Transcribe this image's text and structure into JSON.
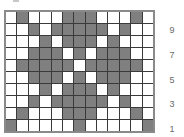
{
  "pattern": {
    "columns": 13,
    "rows": 10,
    "fill_color": "#7f7f7f",
    "empty_color": "#ffffff",
    "grid": [
      [
        0,
        1,
        0,
        0,
        0,
        1,
        1,
        1,
        0,
        0,
        0,
        1,
        0
      ],
      [
        0,
        0,
        1,
        0,
        1,
        1,
        1,
        1,
        1,
        0,
        1,
        0,
        0
      ],
      [
        0,
        0,
        0,
        1,
        0,
        1,
        1,
        1,
        0,
        1,
        0,
        0,
        0
      ],
      [
        0,
        0,
        1,
        1,
        1,
        0,
        1,
        0,
        1,
        1,
        1,
        0,
        0
      ],
      [
        0,
        1,
        1,
        1,
        1,
        1,
        0,
        1,
        1,
        1,
        1,
        1,
        0
      ],
      [
        0,
        0,
        1,
        1,
        1,
        0,
        1,
        0,
        1,
        1,
        1,
        0,
        0
      ],
      [
        0,
        0,
        0,
        1,
        0,
        1,
        1,
        1,
        0,
        1,
        0,
        0,
        0
      ],
      [
        0,
        0,
        1,
        0,
        1,
        1,
        1,
        1,
        1,
        0,
        1,
        0,
        0
      ],
      [
        0,
        1,
        0,
        0,
        0,
        1,
        1,
        1,
        0,
        0,
        0,
        1,
        0
      ],
      [
        1,
        0,
        0,
        0,
        0,
        0,
        1,
        0,
        0,
        0,
        0,
        0,
        1
      ]
    ]
  },
  "row_labels": [
    {
      "text": "9",
      "row_from_top": 1
    },
    {
      "text": "7",
      "row_from_top": 3
    },
    {
      "text": "5",
      "row_from_top": 5
    },
    {
      "text": "3",
      "row_from_top": 7
    },
    {
      "text": "1",
      "row_from_top": 9
    }
  ]
}
